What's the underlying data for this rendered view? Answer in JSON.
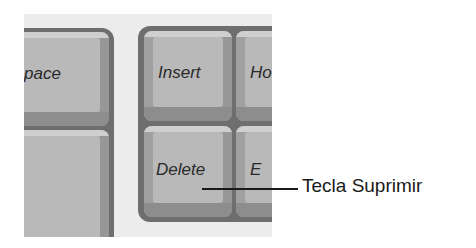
{
  "diagram": {
    "left_cluster": {
      "keys": [
        {
          "id": "space",
          "label": "pace",
          "full_label_partially_visible": "Space"
        },
        {
          "id": "large-key",
          "label": ""
        }
      ]
    },
    "right_cluster": {
      "keys": [
        {
          "id": "insert",
          "label": "Insert"
        },
        {
          "id": "home",
          "label": "Ho"
        },
        {
          "id": "delete",
          "label": "Delete"
        },
        {
          "id": "end",
          "label": "E"
        }
      ]
    },
    "callout": {
      "target": "delete",
      "label": "Tecla Suprimir"
    },
    "colors": {
      "background": "#ffffff",
      "panel": "#ececec",
      "frame": "#6e6e6e",
      "keycap": "#b9b9b9",
      "label_text": "#2a2a2a",
      "callout": "#1a1a1a"
    }
  }
}
